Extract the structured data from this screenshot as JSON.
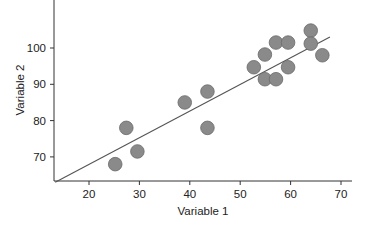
{
  "chart_data": {
    "type": "scatter",
    "title": "",
    "xlabel": "Variable 1",
    "ylabel": "Variable 2",
    "xlim": [
      13.2,
      72.3
    ],
    "ylim": [
      63,
      113.3
    ],
    "xticks": [
      20,
      30,
      40,
      50,
      60,
      70
    ],
    "yticks": [
      70,
      80,
      90,
      100
    ],
    "grid": false,
    "legend": null,
    "series": [
      {
        "name": "observations",
        "marker": "circle",
        "x": [
          25.2,
          27.4,
          29.6,
          39.0,
          43.5,
          43.5,
          52.7,
          54.9,
          54.9,
          57.1,
          57.1,
          59.5,
          59.5,
          64.0,
          64.0,
          66.3
        ],
        "y": [
          68.0,
          78.0,
          71.5,
          85.0,
          88.0,
          78.0,
          94.7,
          98.2,
          91.4,
          101.5,
          91.4,
          101.5,
          94.7,
          104.8,
          101.2,
          98.0
        ]
      }
    ],
    "trendline": {
      "type": "linear",
      "x": [
        13.3,
        67.8
      ],
      "y": [
        63.0,
        103.0
      ]
    }
  },
  "style": {
    "marker_fill": "#8a8a8a",
    "marker_stroke": "#6a6a6a",
    "line_color": "#555555",
    "axis_color": "#333333"
  }
}
